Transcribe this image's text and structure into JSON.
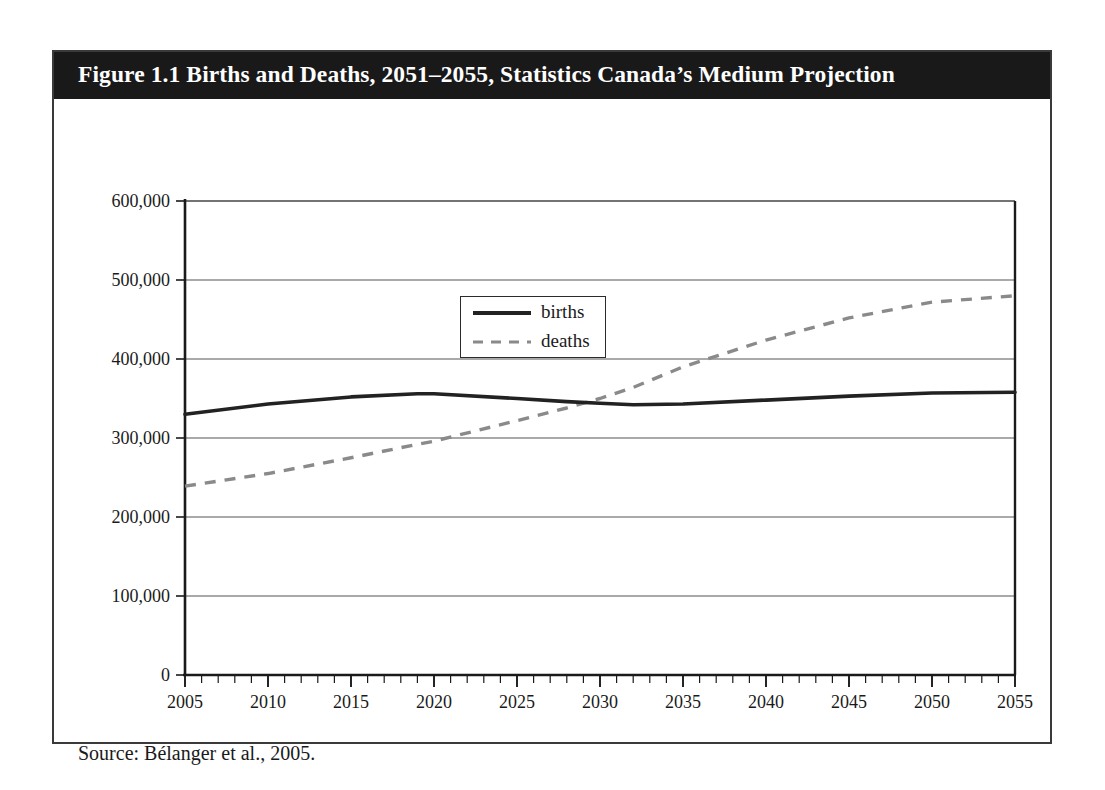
{
  "figure": {
    "title": "Figure 1.1 Births and Deaths, 2051–2055, Statistics Canada’s Medium Projection",
    "source": "Source: Bélanger et al., 2005."
  },
  "legend": {
    "position": "inside-upper-center",
    "entries": [
      {
        "label": "births",
        "style": "solid",
        "color": "#222222"
      },
      {
        "label": "deaths",
        "style": "dashed",
        "color": "#8a8a8a"
      }
    ]
  },
  "colors": {
    "title_bar_bg": "#191919",
    "title_text": "#ffffff",
    "frame_border": "#3a3a3a",
    "axis": "#1a1a1a",
    "gridline": "#555555",
    "births_line": "#222222",
    "deaths_line": "#8a8a8a",
    "page_bg": "#ffffff"
  },
  "chart_data": {
    "type": "line",
    "title": "Figure 1.1 Births and Deaths, 2051–2055, Statistics Canada’s Medium Projection",
    "xlabel": "",
    "ylabel": "",
    "xlim": [
      2005,
      2055
    ],
    "ylim": [
      0,
      600000
    ],
    "grid": true,
    "legend_position": "upper center (inside plot)",
    "x_ticks_major": [
      2005,
      2010,
      2015,
      2020,
      2025,
      2030,
      2035,
      2040,
      2045,
      2050,
      2055
    ],
    "x_tick_labels": [
      "2005",
      "2010",
      "2015",
      "2020",
      "2025",
      "2030",
      "2035",
      "2040",
      "2045",
      "2050",
      "2055"
    ],
    "x_minor_tick_step": 1,
    "y_ticks": [
      0,
      100000,
      200000,
      300000,
      400000,
      500000,
      600000
    ],
    "y_tick_labels": [
      "0",
      "100,000",
      "200,000",
      "300,000",
      "400,000",
      "500,000",
      "600,000"
    ],
    "x": [
      2005,
      2010,
      2015,
      2019,
      2020,
      2025,
      2028,
      2030,
      2032,
      2035,
      2040,
      2045,
      2050,
      2055
    ],
    "series": [
      {
        "name": "births",
        "style": "solid",
        "color": "#222222",
        "values": [
          330000,
          343000,
          352000,
          356000,
          356000,
          350000,
          346000,
          344000,
          342000,
          343000,
          348000,
          353000,
          357000,
          358000
        ]
      },
      {
        "name": "deaths",
        "style": "dashed",
        "color": "#8a8a8a",
        "values": [
          239000,
          255000,
          275000,
          292000,
          296000,
          322000,
          338000,
          350000,
          364000,
          390000,
          424000,
          452000,
          472000,
          480000
        ]
      }
    ],
    "annotations": [
      {
        "text": "births and deaths curves cross at approximately 2029–2030 near 347,000",
        "x": 2029.5,
        "y": 347000
      }
    ]
  }
}
